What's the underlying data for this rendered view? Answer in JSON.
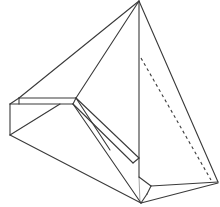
{
  "diagram": {
    "type": "geometric-solid-line-drawing",
    "colors": {
      "background": "#ffffff",
      "line": "#3a3a3a",
      "light_line": "#9a9a9a"
    },
    "vertices": {
      "apex": [
        139,
        1
      ],
      "left_top": [
        10,
        104
      ],
      "left_top_inner": [
        19,
        98
      ],
      "notch": [
        76,
        99
      ],
      "notch_inner": [
        72,
        104
      ],
      "left_bottom": [
        10,
        135
      ],
      "bottom": [
        141,
        203
      ],
      "right": [
        218,
        183
      ],
      "vertical_foot": [
        139,
        178
      ],
      "vertical_notch": [
        151,
        186
      ],
      "dashed_top": [
        141,
        58
      ],
      "dashed_bottom": [
        211,
        180
      ]
    },
    "edges": {
      "solid_count": 20,
      "dashed_count": 1
    }
  }
}
